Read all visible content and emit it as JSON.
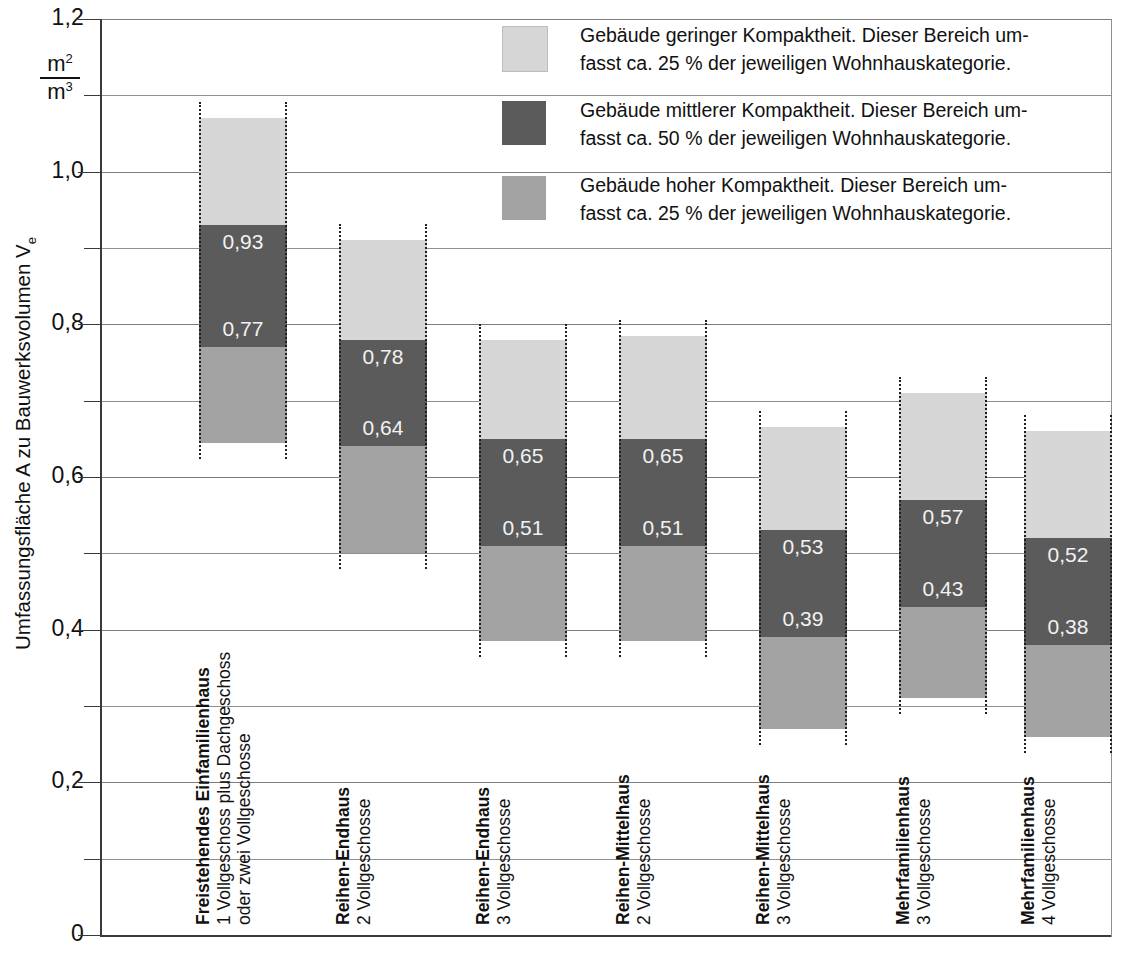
{
  "axis": {
    "y_title_main": "Umfassungsfläche A zu Bauwerksvolumen V",
    "y_title_sub": "e",
    "unit_numerator": "m",
    "unit_numerator_sup": "2",
    "unit_denominator": "m",
    "unit_denominator_sup": "3",
    "y_tick_labels": [
      "1,2",
      "1,0",
      "0,8",
      "0,6",
      "0,4",
      "0,2",
      "0"
    ]
  },
  "legend": {
    "items": [
      {
        "swatch": "low",
        "color": "#d6d6d6",
        "line1": "Gebäude geringer Kompaktheit. Dieser Bereich um-",
        "line2": "fasst ca. 25 % der jeweiligen Wohnhauskategorie."
      },
      {
        "swatch": "mid",
        "color": "#5b5b5b",
        "line1": "Gebäude mittlerer Kompaktheit. Dieser Bereich um-",
        "line2": "fasst ca. 50 % der jeweiligen Wohnhauskategorie."
      },
      {
        "swatch": "high",
        "color": "#a3a3a3",
        "line1": "Gebäude hoher Kompaktheit. Dieser Bereich um-",
        "line2": "fasst ca. 25 % der jeweiligen Wohnhauskategorie."
      }
    ]
  },
  "chart_data": {
    "type": "bar",
    "title": "",
    "xlabel": "",
    "ylabel": "Umfassungsfläche A zu Bauwerksvolumen Ve",
    "ylim": [
      0,
      1.2
    ],
    "ytick_step": 0.2,
    "grid_step": 0.1,
    "grid": true,
    "legend_position": "top-right",
    "value_format": "comma-decimal",
    "categories": [
      {
        "name": "Freistehendes Einfamilienhaus",
        "line2": "1 Vollgeschoss plus Dachgeschoss",
        "line3": "oder zwei Vollgeschosse"
      },
      {
        "name": "Reihen-Endhaus",
        "line2": "2 Vollgeschosse",
        "line3": ""
      },
      {
        "name": "Reihen-Endhaus",
        "line2": "3 Vollgeschosse",
        "line3": ""
      },
      {
        "name": "Reihen-Mittelhaus",
        "line2": "2 Vollgeschosse",
        "line3": ""
      },
      {
        "name": "Reihen-Mittelhaus",
        "line2": "3 Vollgeschosse",
        "line3": ""
      },
      {
        "name": "Mehrfamilienhaus",
        "line2": "3 Vollgeschosse",
        "line3": ""
      },
      {
        "name": "Mehrfamilienhaus",
        "line2": "4 Vollgeschosse",
        "line3": ""
      }
    ],
    "series": [
      {
        "name": "Gebäude geringer Kompaktheit",
        "key": "low",
        "color": "#d6d6d6"
      },
      {
        "name": "Gebäude mittlerer Kompaktheit",
        "key": "mid",
        "color": "#5b5b5b"
      },
      {
        "name": "Gebäude hoher Kompaktheit",
        "key": "high",
        "color": "#a3a3a3"
      }
    ],
    "bars": [
      {
        "top": 1.07,
        "upper": 0.93,
        "lower": 0.77,
        "bottom": 0.645,
        "upper_label": "0,93",
        "lower_label": "0,77"
      },
      {
        "top": 0.91,
        "upper": 0.78,
        "lower": 0.64,
        "bottom": 0.5,
        "upper_label": "0,78",
        "lower_label": "0,64"
      },
      {
        "top": 0.78,
        "upper": 0.65,
        "lower": 0.51,
        "bottom": 0.385,
        "upper_label": "0,65",
        "lower_label": "0,51"
      },
      {
        "top": 0.785,
        "upper": 0.65,
        "lower": 0.51,
        "bottom": 0.385,
        "upper_label": "0,65",
        "lower_label": "0,51"
      },
      {
        "top": 0.665,
        "upper": 0.53,
        "lower": 0.39,
        "bottom": 0.27,
        "upper_label": "0,53",
        "lower_label": "0,39"
      },
      {
        "top": 0.71,
        "upper": 0.57,
        "lower": 0.43,
        "bottom": 0.31,
        "upper_label": "0,57",
        "lower_label": "0,43"
      },
      {
        "top": 0.66,
        "upper": 0.52,
        "lower": 0.38,
        "bottom": 0.26,
        "upper_label": "0,52",
        "lower_label": "0,38"
      }
    ]
  }
}
